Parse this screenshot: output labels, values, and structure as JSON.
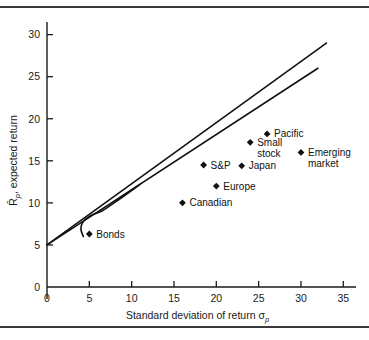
{
  "figure": {
    "name": "risk-return-scatter-figure",
    "background_color": "#ffffff",
    "rule_color": "#3a3a3a"
  },
  "chart_data": {
    "type": "scatter",
    "title": "",
    "subtitle": "",
    "xlabel": "Standard deviation of return σp",
    "xlabel_main": "Standard deviation of return",
    "xlabel_symbol": "σ",
    "xlabel_symbol_sub": "p",
    "ylabel": "R̄p, expected return",
    "ylabel_symbol": "R̄",
    "ylabel_symbol_sub": "p",
    "ylabel_main": ", expected return",
    "xlim": [
      0,
      36.5
    ],
    "ylim": [
      0,
      31.5
    ],
    "xticks": [
      0,
      5,
      10,
      15,
      20,
      25,
      30,
      35
    ],
    "xtick_labels": [
      "0",
      "5",
      "10",
      "15",
      "20",
      "25",
      "30",
      "35"
    ],
    "yticks": [
      0,
      5,
      10,
      15,
      20,
      25,
      30
    ],
    "ytick_labels": [
      "0",
      "5",
      "10",
      "15",
      "20",
      "25",
      "30"
    ],
    "grid": false,
    "legend": "none",
    "marker": "diamond",
    "marker_color": "#111111",
    "line_color": "#111111",
    "points": [
      {
        "label": "Bonds",
        "x": 5.0,
        "y": 6.3,
        "label_dx": 7,
        "label_dy": 3.5,
        "anchor": "start"
      },
      {
        "label": "Canadian",
        "x": 16.0,
        "y": 10.0,
        "label_dx": 7,
        "label_dy": 3.5,
        "anchor": "start"
      },
      {
        "label": "Europe",
        "x": 20.0,
        "y": 12.0,
        "label_dx": 7,
        "label_dy": 3.5,
        "anchor": "start"
      },
      {
        "label": "S&P",
        "x": 18.5,
        "y": 14.5,
        "label_dx": 7,
        "label_dy": 3.5,
        "anchor": "start"
      },
      {
        "label": "Japan",
        "x": 23.0,
        "y": 14.4,
        "label_dx": 7,
        "label_dy": 3.5,
        "anchor": "start"
      },
      {
        "label": "Small stock",
        "x": 24.0,
        "y": 17.2,
        "label_dx": 7,
        "label_dy": 3.5,
        "anchor": "start",
        "lines": [
          "Small",
          "stock"
        ]
      },
      {
        "label": "Pacific",
        "x": 26.0,
        "y": 18.2,
        "label_dx": 7,
        "label_dy": 3.5,
        "anchor": "start"
      },
      {
        "label": "Emerging market",
        "x": 30.0,
        "y": 16.0,
        "label_dx": 7,
        "label_dy": 3.5,
        "anchor": "start",
        "lines": [
          "Emerging",
          "market"
        ]
      }
    ],
    "lines": [
      {
        "name": "capital-market-line-upper",
        "description": "straight tangent line",
        "points": [
          [
            0,
            5.0
          ],
          [
            33.0,
            29.0
          ]
        ]
      },
      {
        "name": "capital-market-line-lower",
        "description": "second straight line",
        "points": [
          [
            0,
            5.0
          ],
          [
            32.0,
            26.0
          ]
        ]
      }
    ],
    "curves": [
      {
        "name": "efficient-frontier-curve",
        "description": "curved minimum-variance frontier merging with the lines",
        "points": [
          [
            4.3,
            6.0
          ],
          [
            4.0,
            6.9
          ],
          [
            4.3,
            7.8
          ],
          [
            5.2,
            8.5
          ],
          [
            6.6,
            9.1
          ],
          [
            8.5,
            10.4
          ],
          [
            11.0,
            12.2
          ]
        ]
      }
    ]
  }
}
